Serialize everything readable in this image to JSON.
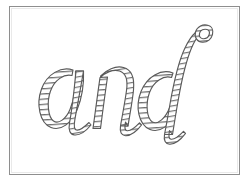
{
  "page": {
    "background_color": "#ffffff",
    "width": 249,
    "height": 189
  },
  "frame": {
    "border_color": "#8e8e8e",
    "fill_color": "#ffffff",
    "x": 9,
    "y": 6,
    "width": 231,
    "height": 169
  },
  "artwork": {
    "type": "handwriting-tracing-worksheet",
    "word": "and",
    "script_style": "cursive-italic",
    "render_style": "hollow-outline-with-horizontal-hatching",
    "outline_color": "#5a5a5a",
    "hatch_color": "#6f6f6f",
    "interior_color": "#ffffff",
    "letters": [
      {
        "char": "a",
        "order": 1,
        "has_ascender": false,
        "has_descender": false
      },
      {
        "char": "n",
        "order": 2,
        "has_ascender": false,
        "has_descender": false
      },
      {
        "char": "d",
        "order": 3,
        "has_ascender": true,
        "has_descender": false,
        "ascender_detail": "curved ascender with small loop at top"
      }
    ],
    "alt_text": "The word and written in outlined cursive letters filled with horizontal stripes"
  }
}
